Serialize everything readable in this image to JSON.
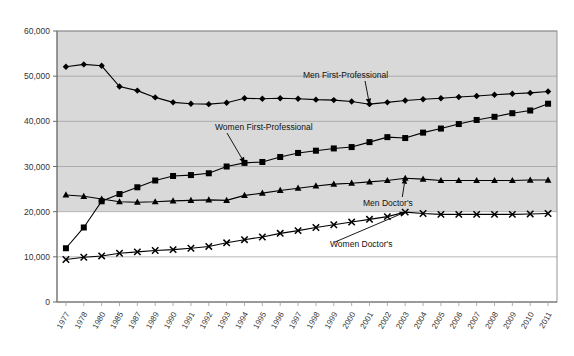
{
  "chart_data": {
    "type": "line",
    "title": "",
    "subtitle": "",
    "xlabel": "",
    "ylabel": "",
    "ylim": [
      0,
      60000
    ],
    "ytick_values": [
      0,
      10000,
      20000,
      30000,
      40000,
      50000,
      60000
    ],
    "ytick_labels": [
      "0",
      "10,000",
      "20,000",
      "30,000",
      "40,000",
      "50,000",
      "60,000"
    ],
    "grid": true,
    "legend": "none (inline annotations with arrows)",
    "plot_bg_upper": "#d9d9d9",
    "plot_bg_lower": "#ffffff",
    "bg_split_value": 20000,
    "categories": [
      "1977",
      "1978",
      "1980",
      "1985",
      "1987",
      "1989",
      "1990",
      "1991",
      "1992",
      "1993",
      "1994",
      "1995",
      "1996",
      "1997",
      "1998",
      "1999",
      "2000",
      "2001",
      "2002",
      "2003",
      "2004",
      "2005",
      "2006",
      "2007",
      "2008",
      "2009",
      "2010",
      "2011"
    ],
    "series": [
      {
        "name": "Men First-Professional",
        "marker": "diamond",
        "color": "#000000",
        "values": [
          52100,
          52600,
          52300,
          47700,
          46800,
          45300,
          44200,
          43900,
          43800,
          44100,
          45100,
          45000,
          45100,
          45000,
          44800,
          44700,
          44400,
          43800,
          44200,
          44600,
          44900,
          45100,
          45400,
          45600,
          45900,
          46100,
          46300,
          46600
        ]
      },
      {
        "name": "Women First-Professional",
        "marker": "square",
        "color": "#000000",
        "values": [
          11900,
          16500,
          22300,
          23900,
          25400,
          26900,
          27900,
          28100,
          28500,
          30000,
          30800,
          31000,
          32100,
          33000,
          33500,
          34000,
          34300,
          35400,
          36500,
          36300,
          37500,
          38400,
          39400,
          40300,
          41000,
          41800,
          42400,
          43900
        ]
      },
      {
        "name": "Men Doctor's",
        "marker": "triangle",
        "color": "#000000",
        "values": [
          23700,
          23400,
          22800,
          22200,
          22100,
          22200,
          22400,
          22500,
          22600,
          22500,
          23600,
          24100,
          24700,
          25200,
          25700,
          26100,
          26300,
          26600,
          26900,
          27400,
          27200,
          26900,
          26900,
          26900,
          26900,
          26900,
          27000,
          27000
        ]
      },
      {
        "name": "Women Doctor's",
        "marker": "cross",
        "color": "#000000",
        "values": [
          9400,
          9900,
          10200,
          10800,
          11100,
          11400,
          11600,
          11900,
          12300,
          13100,
          13800,
          14400,
          15200,
          15800,
          16500,
          17100,
          17700,
          18300,
          18900,
          19900,
          19600,
          19400,
          19400,
          19400,
          19400,
          19400,
          19500,
          19600
        ]
      }
    ],
    "annotations": [
      {
        "text": "Men First-Professional",
        "target_series": "Men First-Professional",
        "target_category": "2001"
      },
      {
        "text": "Women First-Professional",
        "target_series": "Women First-Professional",
        "target_category": "1994"
      },
      {
        "text": "Men Doctor's",
        "target_series": "Men Doctor's",
        "target_category": "2003"
      },
      {
        "text": "Women Doctor's",
        "target_series": "Women Doctor's",
        "target_category": "2003"
      }
    ]
  }
}
